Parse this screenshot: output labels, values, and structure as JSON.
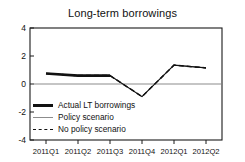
{
  "chart_data": {
    "type": "line",
    "title": "Long-term borrowings",
    "xlabel": "",
    "ylabel": "",
    "categories": [
      "2011Q1",
      "2011Q2",
      "2011Q3",
      "2011Q4",
      "2012Q1",
      "2012Q2"
    ],
    "ylim": [
      -4,
      4
    ],
    "yticks": [
      4,
      2,
      0,
      -2,
      -4
    ],
    "ytick_labels": [
      "4",
      "2",
      "0",
      "-2",
      "-4"
    ],
    "grid": false,
    "zero_line": 0,
    "legend_position": "lower left",
    "series": [
      {
        "name": "Actual LT borrowings",
        "style": "solid-thick",
        "color": "#111111",
        "values": [
          0.75,
          0.6,
          0.6,
          null,
          null,
          null
        ]
      },
      {
        "name": "Policy scenario",
        "style": "solid-thin",
        "color": "#8c8c8c",
        "values": [
          0.75,
          0.6,
          0.6,
          -0.9,
          1.35,
          1.15
        ]
      },
      {
        "name": "No policy scenario",
        "style": "dashed",
        "color": "#111111",
        "values": [
          0.75,
          0.6,
          0.6,
          -0.9,
          1.35,
          1.15
        ]
      }
    ]
  },
  "axis": {
    "ytick_0": "4",
    "ytick_1": "2",
    "ytick_2": "0",
    "ytick_3": "-2",
    "ytick_4": "-4",
    "xtick_0": "2011Q1",
    "xtick_1": "2011Q2",
    "xtick_2": "2011Q3",
    "xtick_3": "2011Q4",
    "xtick_4": "2012Q1",
    "xtick_5": "2012Q2"
  },
  "legend": {
    "items": [
      {
        "label": "Actual LT borrowings"
      },
      {
        "label": "Policy scenario"
      },
      {
        "label": "No policy scenario"
      }
    ]
  },
  "colors": {
    "line": "#111111",
    "policy": "#8c8c8c",
    "frame": "#1a1a1a",
    "background": "#ffffff"
  }
}
